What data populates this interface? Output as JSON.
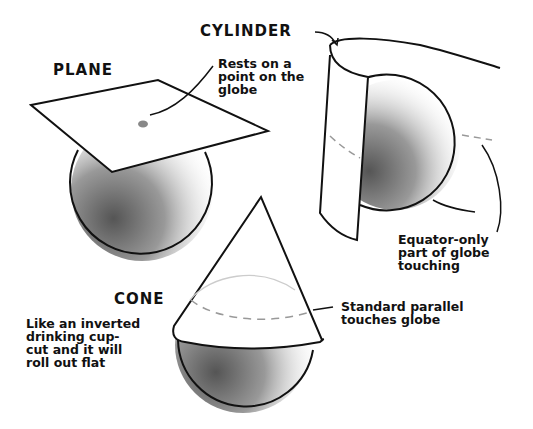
{
  "diagram": {
    "colors": {
      "ink": "#111111",
      "background": "#ffffff",
      "dot": "#888888",
      "dash": "#999999"
    },
    "plane": {
      "title": "PLANE",
      "note": "Rests on a\npoint on the\nglobe"
    },
    "cylinder": {
      "title": "CYLINDER",
      "note": "Equator-only\npart of globe\ntouching"
    },
    "cone": {
      "title": "CONE",
      "note_left": "Like an inverted\ndrinking cup-\ncut and it will\nroll out flat",
      "note_right": "Standard parallel\ntouches globe"
    }
  }
}
